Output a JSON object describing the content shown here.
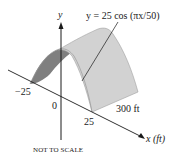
{
  "diagram": {
    "equation": "y = 25 cos (πx/50)",
    "axes": {
      "y_label": "y",
      "x_label": "x (ft)"
    },
    "ticks": {
      "neg": "−25",
      "zero": "0",
      "pos": "25"
    },
    "length_label": "300 ft",
    "note": "NOT TO SCALE",
    "colors": {
      "surface_light": "#d2d2d2",
      "surface_dark": "#7f7f7f",
      "edge": "#9a9a9a",
      "axis": "#1a1a1a"
    }
  }
}
